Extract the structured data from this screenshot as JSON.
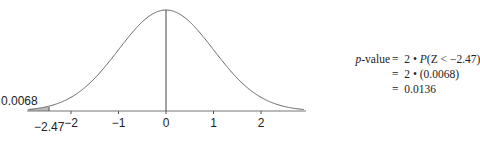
{
  "chart_data": {
    "type": "line",
    "title": "",
    "xlabel": "",
    "ylabel": "",
    "x_ticks": [
      -2,
      -1,
      0,
      1,
      2
    ],
    "x_tick_labels": [
      "−2",
      "−1",
      "0",
      "1",
      "2"
    ],
    "xlim": [
      -2.9,
      2.9
    ],
    "grid": false,
    "shaded_region": {
      "from": -2.9,
      "to": -2.47,
      "area": 0.0068
    },
    "annotations": [
      {
        "text": "0.0068",
        "meaning": "left tail area"
      },
      {
        "text": "−2.47",
        "meaning": "test statistic z"
      }
    ],
    "reference_line_x": 0
  },
  "labels": {
    "tail_area": "0.0068",
    "z_value": "−2.47",
    "ticks": [
      "−2",
      "−1",
      "0",
      "1",
      "2"
    ]
  },
  "formula": {
    "lhs_italic": "p",
    "lhs_rest": "-value",
    "eq": "=",
    "line1_prefix": "2 • ",
    "line1_italic": "P",
    "line1_rest": "(Z < −2.47)",
    "line2": "2 • (0.0068)",
    "line3": "0.0136"
  }
}
